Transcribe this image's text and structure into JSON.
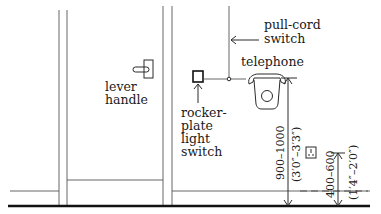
{
  "diagram": {
    "type": "architectural elevation",
    "labels": {
      "lever_handle": [
        "lever",
        "handle"
      ],
      "pull_cord_switch": [
        "pull-cord",
        "switch"
      ],
      "telephone": "telephone",
      "rocker_switch": [
        "rocker-",
        "plate",
        "light",
        "switch"
      ]
    },
    "dimensions": {
      "telephone_height_mm": "900–1000",
      "telephone_height_imperial": "(3′0″–3′3″)",
      "socket_height_mm": "400–600",
      "socket_height_imperial": "(1′4″–2′0″)"
    },
    "colors": {
      "line": "#2a2a2a",
      "background": "#ffffff"
    }
  }
}
